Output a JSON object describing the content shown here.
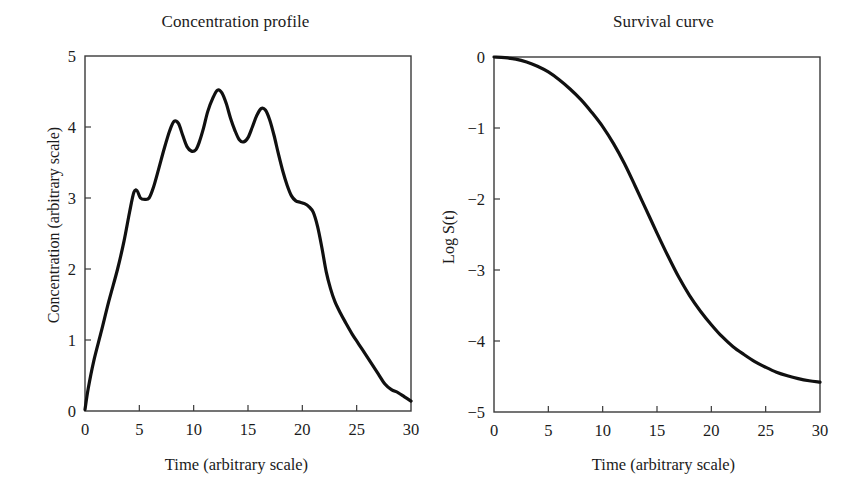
{
  "figure": {
    "background": "#ffffff",
    "curve_color": "#101010",
    "axis_color": "#3a3a3a",
    "panel_count": 2
  },
  "chart_data": [
    {
      "type": "line",
      "title": "Concentration profile",
      "xlabel": "Time (arbitrary scale)",
      "ylabel": "Concentration (arbitrary scale)",
      "xlim": [
        0,
        30
      ],
      "ylim": [
        0,
        5
      ],
      "xticks": [
        0,
        5,
        10,
        15,
        20,
        25,
        30
      ],
      "yticks": [
        0,
        1,
        2,
        3,
        4,
        5
      ],
      "xticklabels": [
        "0",
        "5",
        "10",
        "15",
        "20",
        "25",
        "30"
      ],
      "yticklabels": [
        "0",
        "1",
        "2",
        "3",
        "4",
        "5"
      ],
      "grid": false,
      "legend": null,
      "series": [
        {
          "name": "concentration",
          "x": [
            0.0,
            0.3,
            0.8,
            1.5,
            2.2,
            3.0,
            3.6,
            4.1,
            4.5,
            4.8,
            5.1,
            5.5,
            5.9,
            6.3,
            6.8,
            7.3,
            7.8,
            8.2,
            8.6,
            9.0,
            9.4,
            9.8,
            10.2,
            10.5,
            10.9,
            11.3,
            11.8,
            12.2,
            12.6,
            13.0,
            13.4,
            13.8,
            14.2,
            14.6,
            15.0,
            15.4,
            15.8,
            16.2,
            16.6,
            17.0,
            17.4,
            17.8,
            18.2,
            18.6,
            19.0,
            19.4,
            19.8,
            20.2,
            20.6,
            21.0,
            21.4,
            21.8,
            22.2,
            22.6,
            23.0,
            23.5,
            24.0,
            24.6,
            25.2,
            25.8,
            26.4,
            27.0,
            27.6,
            28.2,
            28.8,
            29.4,
            30.0
          ],
          "y": [
            0.02,
            0.32,
            0.7,
            1.12,
            1.55,
            2.0,
            2.4,
            2.8,
            3.08,
            3.1,
            3.0,
            2.98,
            3.0,
            3.15,
            3.42,
            3.7,
            3.95,
            4.08,
            4.05,
            3.88,
            3.72,
            3.66,
            3.68,
            3.78,
            3.98,
            4.22,
            4.42,
            4.52,
            4.48,
            4.33,
            4.12,
            3.95,
            3.82,
            3.79,
            3.85,
            4.0,
            4.16,
            4.26,
            4.24,
            4.1,
            3.88,
            3.62,
            3.38,
            3.18,
            3.03,
            2.96,
            2.94,
            2.92,
            2.88,
            2.8,
            2.6,
            2.3,
            1.96,
            1.72,
            1.54,
            1.38,
            1.24,
            1.08,
            0.94,
            0.8,
            0.66,
            0.52,
            0.38,
            0.3,
            0.26,
            0.2,
            0.14
          ]
        }
      ]
    },
    {
      "type": "line",
      "title": "Survival curve",
      "xlabel": "Time (arbitrary scale)",
      "ylabel": "Log S(t)",
      "xlim": [
        0,
        30
      ],
      "ylim": [
        -5,
        0
      ],
      "xticks": [
        0,
        5,
        10,
        15,
        20,
        25,
        30
      ],
      "yticks": [
        -5,
        -4,
        -3,
        -2,
        -1,
        0
      ],
      "xticklabels": [
        "0",
        "5",
        "10",
        "15",
        "20",
        "25",
        "30"
      ],
      "yticklabels": [
        "−5",
        "−4",
        "−3",
        "−2",
        "−1",
        "0"
      ],
      "grid": false,
      "legend": null,
      "series": [
        {
          "name": "log-survival",
          "x": [
            0,
            1,
            2,
            3,
            4,
            5,
            6,
            7,
            8,
            9,
            10,
            11,
            12,
            13,
            14,
            15,
            16,
            17,
            18,
            19,
            20,
            21,
            22,
            23,
            24,
            25,
            26,
            27,
            28,
            29,
            30
          ],
          "y": [
            0.0,
            -0.01,
            -0.03,
            -0.07,
            -0.13,
            -0.21,
            -0.32,
            -0.45,
            -0.6,
            -0.78,
            -0.98,
            -1.22,
            -1.5,
            -1.82,
            -2.15,
            -2.48,
            -2.8,
            -3.1,
            -3.36,
            -3.58,
            -3.77,
            -3.94,
            -4.08,
            -4.19,
            -4.29,
            -4.37,
            -4.44,
            -4.49,
            -4.53,
            -4.56,
            -4.58
          ]
        }
      ]
    }
  ]
}
